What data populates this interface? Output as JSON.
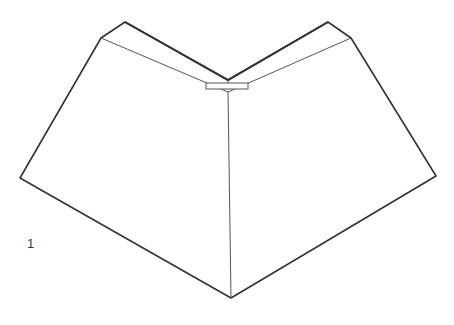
{
  "figure": {
    "label": "1",
    "stroke_color": "#333333",
    "background": "#ffffff"
  }
}
